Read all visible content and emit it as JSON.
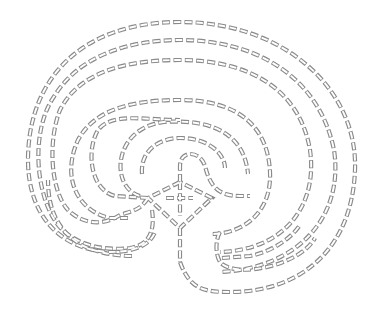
{
  "diagram": {
    "type": "labyrinth",
    "circuits": 7,
    "line_style": "dashed outlined rectangles",
    "colors": {
      "stroke": "#8a8a8a",
      "background": "#ffffff"
    },
    "elements": [
      {
        "name": "seed-cross",
        "description": "central cross with four corner dots joined into a diamond"
      },
      {
        "name": "walls",
        "count": 8
      },
      {
        "name": "entrance",
        "position": "bottom-center"
      }
    ]
  }
}
